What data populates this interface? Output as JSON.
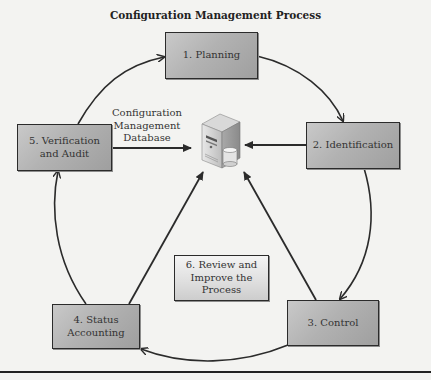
{
  "title": "Configuration Management Process",
  "steps": [
    {
      "id": 1,
      "label": "1. Planning"
    },
    {
      "id": 2,
      "label": "2. Identification"
    },
    {
      "id": 3,
      "label": "3. Control"
    },
    {
      "id": 4,
      "label_line1": "4. Status",
      "label_line2": "Accounting"
    },
    {
      "id": 5,
      "label_line1": "5. Verification",
      "label_line2": "and Audit"
    },
    {
      "id": 6,
      "label_line1": "6. Review and",
      "label_line2": "Improve the",
      "label_line3": "Process"
    }
  ],
  "database": {
    "label_line1": "Configuration",
    "label_line2": "Management",
    "label_line3": "Database",
    "icon": "server-database-icon"
  },
  "colors": {
    "box_fill": "#b2b2b2",
    "review_fill": "#e0e0e0",
    "stroke": "#2b2b2b",
    "background": "#f3f3f1"
  }
}
